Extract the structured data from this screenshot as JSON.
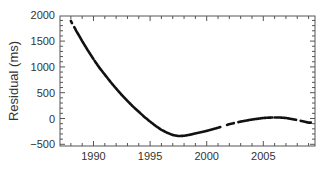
{
  "chart_data": {
    "type": "line",
    "title": "",
    "xlabel": "",
    "ylabel": "Residual (ms)",
    "xlim": [
      1987.0,
      2009.6
    ],
    "ylim": [
      -500,
      2000
    ],
    "grid": false,
    "legend": null,
    "x_ticks": [
      1990,
      1995,
      2000,
      2005
    ],
    "y_ticks": [
      -500,
      0,
      500,
      1000,
      1500,
      2000
    ],
    "x_tick_labels": [
      "1990",
      "1995",
      "2000",
      "2005"
    ],
    "y_tick_labels": [
      "−500",
      "0",
      "500",
      "1000",
      "1500",
      "2000"
    ],
    "series": [
      {
        "name": "Residual",
        "color": "#111111",
        "style": "dense points (segmented)",
        "x": [
          1988.0,
          1988.5,
          1989.0,
          1989.5,
          1990.0,
          1990.5,
          1991.0,
          1991.5,
          1992.0,
          1992.5,
          1993.0,
          1993.5,
          1994.0,
          1994.5,
          1995.0,
          1995.5,
          1996.0,
          1996.5,
          1997.0,
          1997.5,
          1998.0,
          1998.5,
          1999.0,
          1999.5,
          2000.0,
          2000.5,
          2001.0,
          2001.5,
          2002.0,
          2002.5,
          2003.0,
          2003.5,
          2004.0,
          2004.5,
          2005.0,
          2005.5,
          2006.0,
          2006.5,
          2007.0,
          2007.5,
          2008.0,
          2008.5,
          2009.0
        ],
        "y": [
          1890,
          1690,
          1500,
          1320,
          1150,
          990,
          850,
          710,
          580,
          455,
          340,
          230,
          130,
          30,
          -60,
          -145,
          -220,
          -275,
          -320,
          -340,
          -335,
          -315,
          -290,
          -265,
          -240,
          -210,
          -180,
          -145,
          -110,
          -85,
          -60,
          -40,
          -20,
          -5,
          10,
          17,
          20,
          18,
          10,
          -10,
          -30,
          -55,
          -80
        ]
      }
    ],
    "segments": [
      [
        1988.0,
        1988.1
      ],
      [
        1988.3,
        1990.0
      ],
      [
        1990.1,
        2001.2
      ],
      [
        2001.8,
        2002.4
      ],
      [
        2002.8,
        2005.8
      ],
      [
        2006.0,
        2007.9
      ],
      [
        2008.3,
        2009.2
      ]
    ]
  }
}
